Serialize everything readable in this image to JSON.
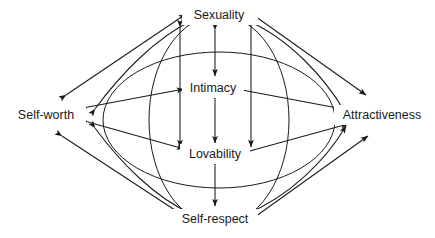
{
  "diagram": {
    "background_color": "#ffffff",
    "line_color": "#1a1a1a",
    "text_color": "#1a1a1a",
    "nodes": [
      {
        "id": "sexuality",
        "label": "Sexuality",
        "x": 219,
        "y": 15
      },
      {
        "id": "self-worth",
        "label": "Self-worth",
        "x": 46,
        "y": 115
      },
      {
        "id": "attractiveness",
        "label": "Attractiveness",
        "x": 382,
        "y": 115
      },
      {
        "id": "intimacy",
        "label": "Intimacy",
        "x": 212,
        "y": 88
      },
      {
        "id": "lovability",
        "label": "Lovability",
        "x": 212,
        "y": 154
      },
      {
        "id": "self-respect",
        "label": "Self-respect",
        "x": 215,
        "y": 219
      }
    ],
    "shapes": [
      {
        "id": "horizontal-ellipse",
        "type": "ellipse",
        "cx": 219,
        "cy": 120,
        "rx": 116,
        "ry": 68
      },
      {
        "id": "vertical-ellipse",
        "type": "ellipse",
        "cx": 219,
        "cy": 120,
        "rx": 70,
        "ry": 105
      }
    ],
    "edges": [
      {
        "id": "self-worth--sexuality",
        "from": "Self-worth",
        "to": "Sexuality",
        "style": "straight",
        "arrowheads": "both"
      },
      {
        "id": "sexuality--attractiveness",
        "from": "Sexuality",
        "to": "Attractiveness",
        "style": "straight",
        "arrowheads": "both"
      },
      {
        "id": "self-worth--self-respect",
        "from": "Self-worth",
        "to": "Self-respect",
        "style": "straight",
        "arrowheads": "both"
      },
      {
        "id": "self-respect--attractiveness",
        "from": "Self-respect",
        "to": "Attractiveness",
        "style": "straight",
        "arrowheads": "both"
      },
      {
        "id": "self-worth--sexuality-curve",
        "from": "Self-worth",
        "to": "Sexuality",
        "style": "curved",
        "arrowheads": "both"
      },
      {
        "id": "sexuality--attractiveness-curve",
        "from": "Sexuality",
        "to": "Attractiveness",
        "style": "curved",
        "arrowheads": "both"
      },
      {
        "id": "self-worth--self-respect-curve",
        "from": "Self-worth",
        "to": "Self-respect",
        "style": "curved",
        "arrowheads": "both"
      },
      {
        "id": "self-respect--attractiveness-curve",
        "from": "Self-respect",
        "to": "Attractiveness",
        "style": "curved",
        "arrowheads": "both"
      },
      {
        "id": "sexuality--lovability-left",
        "from": "Sexuality",
        "to": "Lovability",
        "style": "straight",
        "arrowheads": "both"
      },
      {
        "id": "sexuality--lovability-right",
        "from": "Sexuality",
        "to": "Lovability",
        "style": "straight",
        "arrowheads": "both"
      },
      {
        "id": "sexuality--intimacy",
        "from": "Sexuality",
        "to": "Intimacy",
        "style": "straight",
        "arrowheads": "both"
      },
      {
        "id": "intimacy--lovability",
        "from": "Intimacy",
        "to": "Lovability",
        "style": "straight",
        "arrowheads": "both"
      },
      {
        "id": "lovability--self-respect",
        "from": "Lovability",
        "to": "Self-respect",
        "style": "straight",
        "arrowheads": "both"
      },
      {
        "id": "self-worth--intimacy",
        "from": "Self-worth",
        "to": "Intimacy",
        "style": "straight",
        "arrowheads": "both"
      },
      {
        "id": "self-worth--lovability",
        "from": "Self-worth",
        "to": "Lovability",
        "style": "straight",
        "arrowheads": "both"
      },
      {
        "id": "intimacy--attractiveness",
        "from": "Intimacy",
        "to": "Attractiveness",
        "style": "straight",
        "arrowheads": "both"
      },
      {
        "id": "lovability--attractiveness",
        "from": "Lovability",
        "to": "Attractiveness",
        "style": "straight",
        "arrowheads": "both"
      }
    ]
  }
}
